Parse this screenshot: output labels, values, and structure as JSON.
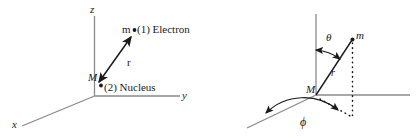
{
  "figure": {
    "width": 417,
    "height": 136,
    "background": "#ffffff",
    "axis_color": "#8a8a8a",
    "ink_color": "#1a1a1a"
  },
  "left_panel": {
    "name": "two-body-vector-diagram",
    "axes": {
      "z_label": "z",
      "y_label": "y",
      "x_label": "x"
    },
    "particles": {
      "electron_mass_symbol": "m",
      "electron_label": "(1)  Electron",
      "nucleus_mass_symbol": "M",
      "nucleus_label": "(2)  Nucleus"
    },
    "vector": {
      "label": "r",
      "arrow_style": "double-headed"
    }
  },
  "right_panel": {
    "name": "spherical-coordinates-diagram",
    "origin_label": "M",
    "point_label": "m",
    "radial_label": "r",
    "polar_angle_label": "θ",
    "azimuthal_angle_label": "ϕ",
    "projection_style": "dotted"
  }
}
